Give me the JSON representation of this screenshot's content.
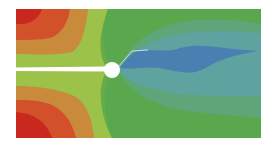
{
  "figure": {
    "colors": {
      "background": "#ffffff",
      "red": "#c8281e",
      "orange_red": "#d2502a",
      "orange": "#c98a3c",
      "yellow_green": "#9cc24a",
      "light_green": "#8cc04a",
      "green": "#66ad4a",
      "green2": "#5aa84e",
      "teal_green": "#5fa57a",
      "teal": "#5ea3a0",
      "blue": "#4a7fb2",
      "crack": "#ffffff"
    }
  }
}
